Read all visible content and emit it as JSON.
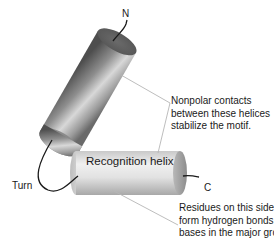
{
  "diagram": {
    "type": "helix-turn-helix motif",
    "labels": {
      "n_terminus": "N",
      "c_terminus": "C",
      "turn": "Turn",
      "recognition_helix": "Recognition helix"
    },
    "annotations": [
      {
        "id": "nonpolar",
        "lines": [
          "Nonpolar contacts",
          "between these helices",
          "stabilize the motif."
        ]
      },
      {
        "id": "residues",
        "lines": [
          "Residues on this side",
          "form hydrogen bonds with",
          "bases in the major groove."
        ]
      }
    ],
    "colors": {
      "cylinder_dark": "#5a5a5a",
      "cylinder_mid": "#9a9a9a",
      "cylinder_light": "#e4e4e4",
      "recognition_light": "#eeeeee",
      "recognition_mid": "#c8c8c8",
      "leader_line": "#b0b0b0",
      "text": "#1a1a1a"
    }
  }
}
